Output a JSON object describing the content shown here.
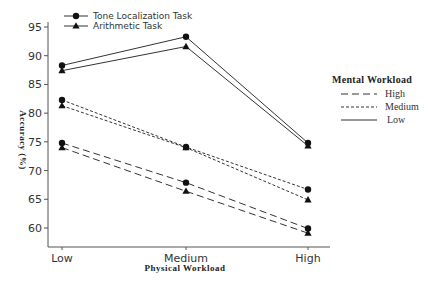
{
  "chart_data": {
    "type": "line",
    "title": "",
    "xlabel": "Physical Workload",
    "ylabel": "Accuracy (%)",
    "categories": [
      "Low",
      "Medium",
      "High"
    ],
    "yticks": [
      60,
      65,
      70,
      75,
      80,
      85,
      90,
      95
    ],
    "ylim": [
      56.5,
      96
    ],
    "grid": false,
    "series": [
      {
        "name": "Tone Localization Task - Low Mental Workload",
        "task": "Tone Localization Task",
        "mental_workload": "Low",
        "marker": "circle",
        "dash": "solid",
        "values": [
          88.3,
          93.3,
          74.8
        ]
      },
      {
        "name": "Arithmetic Task - Low Mental Workload",
        "task": "Arithmetic Task",
        "mental_workload": "Low",
        "marker": "triangle",
        "dash": "solid",
        "values": [
          87.4,
          91.6,
          74.3
        ]
      },
      {
        "name": "Tone Localization Task - Medium Mental Workload",
        "task": "Tone Localization Task",
        "mental_workload": "Medium",
        "marker": "circle",
        "dash": "short",
        "values": [
          82.3,
          74.1,
          66.7
        ]
      },
      {
        "name": "Arithmetic Task - Medium Mental Workload",
        "task": "Arithmetic Task",
        "mental_workload": "Medium",
        "marker": "triangle",
        "dash": "short",
        "values": [
          81.3,
          74.0,
          64.9
        ]
      },
      {
        "name": "Tone Localization Task - High Mental Workload",
        "task": "Tone Localization Task",
        "mental_workload": "High",
        "marker": "circle",
        "dash": "long",
        "values": [
          74.8,
          67.9,
          59.9
        ]
      },
      {
        "name": "Arithmetic Task - High Mental Workload",
        "task": "Arithmetic Task",
        "mental_workload": "High",
        "marker": "triangle",
        "dash": "long",
        "values": [
          74.0,
          66.4,
          59.1
        ]
      }
    ],
    "legend_task": {
      "position": "top-left",
      "entries": [
        {
          "label": "Tone Localization Task",
          "marker": "circle"
        },
        {
          "label": "Arithmetic Task",
          "marker": "triangle"
        }
      ]
    },
    "legend_workload": {
      "position": "right",
      "title": "Mental Workload",
      "entries": [
        {
          "label": "High",
          "dash": "long"
        },
        {
          "label": "Medium",
          "dash": "short"
        },
        {
          "label": "Low",
          "dash": "solid"
        }
      ]
    },
    "colors": {
      "line": "#333333",
      "axis": "#444444",
      "text": "#333333"
    }
  }
}
